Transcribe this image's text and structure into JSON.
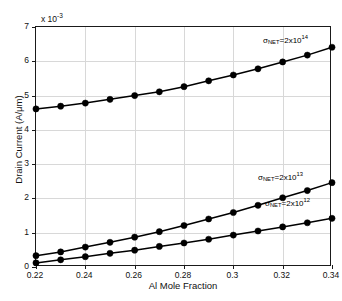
{
  "chart_data": {
    "type": "line",
    "title": "",
    "xlabel": "Al Mole Fraction",
    "ylabel": "Drain Current (A/μm)",
    "y_exponent_label": "x 10",
    "y_exponent_value": "-3",
    "y_scale_factor": 0.001,
    "xlim": [
      0.22,
      0.34
    ],
    "ylim": [
      0,
      7
    ],
    "xticks": [
      0.22,
      0.24,
      0.26,
      0.28,
      0.3,
      0.32,
      0.34
    ],
    "xticklabels": [
      "0.22",
      "0.24",
      "0.26",
      "0.28",
      "0.3",
      "0.32",
      "0.34"
    ],
    "yticks": [
      0,
      1,
      2,
      3,
      4,
      5,
      6,
      7
    ],
    "yticklabels": [
      "0",
      "1",
      "2",
      "3",
      "4",
      "5",
      "6",
      "7"
    ],
    "grid": true,
    "legend": "none",
    "marker": "filled-circle",
    "line_color": "#000000",
    "grid_color": "#d8d8d8",
    "axis_color": "#1a1a1a",
    "x": [
      0.22,
      0.23,
      0.24,
      0.25,
      0.26,
      0.27,
      0.28,
      0.29,
      0.3,
      0.31,
      0.32,
      0.33,
      0.34
    ],
    "series": [
      {
        "name": "sigma_NET = 2x10^14",
        "values": [
          4.61,
          4.69,
          4.78,
          4.89,
          5.0,
          5.11,
          5.26,
          5.43,
          5.6,
          5.78,
          5.98,
          6.18,
          6.41
        ]
      },
      {
        "name": "sigma_NET = 2x10^13",
        "values": [
          0.33,
          0.44,
          0.58,
          0.72,
          0.87,
          1.03,
          1.21,
          1.4,
          1.59,
          1.8,
          2.02,
          2.23,
          2.46
        ]
      },
      {
        "name": "sigma_NET = 2x10^12",
        "values": [
          0.12,
          0.21,
          0.3,
          0.4,
          0.49,
          0.6,
          0.7,
          0.81,
          0.93,
          1.05,
          1.17,
          1.29,
          1.42
        ]
      }
    ],
    "annotations": [
      {
        "id": "annot-top",
        "symbol": "σ",
        "subscript": "NET",
        "equals": "=2x10",
        "exponent": "14",
        "x_px": 263,
        "y_px": 35
      },
      {
        "id": "annot-middle",
        "symbol": "σ",
        "subscript": "NET",
        "equals": "=2x10",
        "exponent": "13",
        "x_px": 258,
        "y_px": 172
      },
      {
        "id": "annot-bottom",
        "symbol": "σ",
        "subscript": "NET",
        "equals": "=2x10",
        "exponent": "12",
        "x_px": 265,
        "y_px": 198
      }
    ]
  }
}
